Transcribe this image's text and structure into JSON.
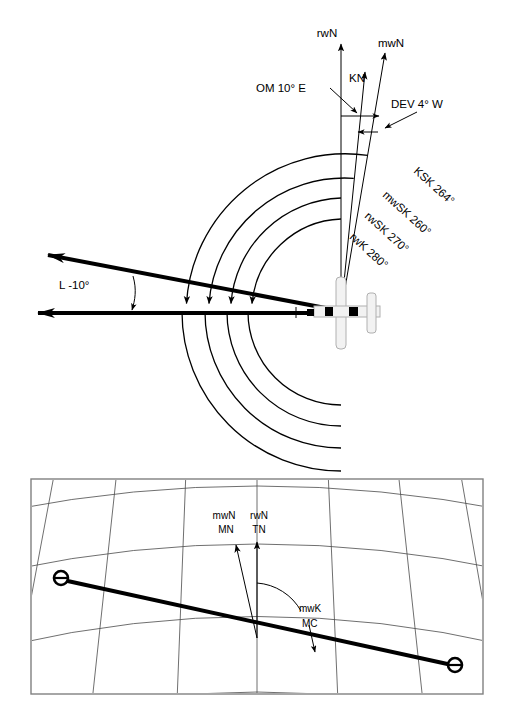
{
  "figure": {
    "panels": [
      {
        "id": "upper",
        "name": "angle-relations-panel"
      },
      {
        "id": "lower",
        "name": "chart-projection-panel"
      }
    ]
  },
  "upper_panel": {
    "north_references": [
      {
        "key": "rwN",
        "label": "rwN",
        "name": "true-north-label"
      },
      {
        "key": "KN",
        "label": "KN",
        "name": "compass-north-label"
      },
      {
        "key": "mwN",
        "label": "mwN",
        "name": "magnetic-north-label"
      }
    ],
    "angle_callouts": [
      {
        "key": "OM",
        "label": "OM 10° E",
        "name": "variation-callout",
        "value": 10,
        "direction": "E"
      },
      {
        "key": "DEV",
        "label": "DEV 4° W",
        "name": "deviation-callout",
        "value": 4,
        "direction": "W"
      }
    ],
    "drift_callout": {
      "label": "L -10°",
      "name": "drift-angle-callout",
      "value": -10
    },
    "arcs": [
      {
        "key": "KSK",
        "label": "KSK 264°",
        "value": 264,
        "name": "compass-track-arc"
      },
      {
        "key": "mwSK",
        "label": "mwSK 260°",
        "value": 260,
        "name": "magnetic-track-arc"
      },
      {
        "key": "rwSK",
        "label": "rwSK 270°",
        "value": 270,
        "name": "true-track-arc"
      },
      {
        "key": "rwK",
        "label": "rwK 280°",
        "value": 280,
        "name": "true-heading-arc"
      }
    ],
    "aircraft": {
      "name": "aircraft-symbol",
      "heading_label": "rwK 280°"
    }
  },
  "lower_panel": {
    "north_labels": [
      {
        "line1": "mwN",
        "line2": "MN",
        "name": "magnetic-north-label-chart"
      },
      {
        "line1": "rwN",
        "line2": "TN",
        "name": "true-north-label-chart"
      }
    ],
    "course_callout": {
      "line1": "mwK",
      "line2": "MC",
      "name": "magnetic-course-callout"
    },
    "waypoints": [
      {
        "name": "waypoint-start",
        "position": "northwest"
      },
      {
        "name": "waypoint-end",
        "position": "southeast"
      }
    ],
    "course_line": {
      "name": "course-line"
    },
    "graticule": {
      "name": "graticule",
      "projection": "conic"
    }
  },
  "colors": {
    "stroke": "#000000",
    "graticule": "#4a4a4a",
    "frame": "#808080",
    "background": "#ffffff"
  }
}
